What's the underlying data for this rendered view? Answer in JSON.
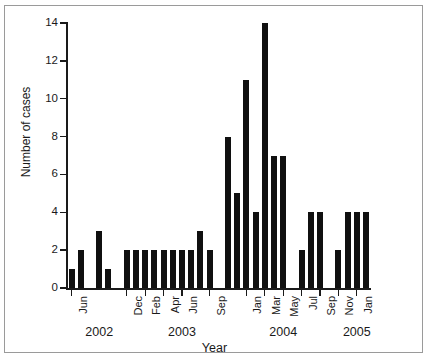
{
  "figure": {
    "title": "",
    "border_color": "#9a9a9a",
    "background": "#ffffff"
  },
  "axis": {
    "y_title": "Number of cases",
    "x_title": "Year",
    "bar_color": "#101010",
    "axis_color": "#1a1a1a"
  },
  "chart_data": {
    "type": "bar",
    "title": "",
    "subtitle": "",
    "xlabel": "Year",
    "ylabel": "Number of cases",
    "ylim": [
      0,
      14
    ],
    "yticks": [
      0,
      2,
      4,
      6,
      8,
      10,
      12,
      14
    ],
    "ytick_labels": [
      "0",
      "2",
      "4",
      "6",
      "8",
      "10",
      "12",
      "14"
    ],
    "grid": false,
    "legend": null,
    "legend_position": "none",
    "bar_color": "#101010",
    "x_tick_labels_shown": [
      "Jun",
      "Dec",
      "Feb",
      "Apr",
      "Jun",
      "Sep",
      "Jan",
      "Mar",
      "May",
      "Jul",
      "Sep",
      "Nov",
      "Jan"
    ],
    "year_group_labels": [
      "2002",
      "2003",
      "2004",
      "2005"
    ],
    "categories": [
      "Jun 2002",
      "Jul 2002",
      "Aug 2002",
      "Sep 2002",
      "Oct 2002",
      "Nov 2002",
      "Dec 2002",
      "Jan 2003",
      "Feb 2003",
      "Mar 2003",
      "Apr 2003",
      "May 2003",
      "Jun 2003",
      "Jul 2003",
      "Aug 2003",
      "Sep 2003",
      "Oct 2003",
      "Nov 2003",
      "Dec 2003",
      "Jan 2004",
      "Feb 2004",
      "Mar 2004",
      "Apr 2004",
      "May 2004",
      "Jun 2004",
      "Jul 2004",
      "Aug 2004",
      "Sep 2004",
      "Oct 2004",
      "Nov 2004",
      "Dec 2004",
      "Jan 2005",
      "Feb 2005"
    ],
    "values": [
      1,
      2,
      0,
      3,
      1,
      0,
      2,
      2,
      2,
      2,
      2,
      2,
      2,
      2,
      3,
      2,
      0,
      8,
      5,
      11,
      4,
      14,
      7,
      7,
      0,
      2,
      4,
      4,
      0,
      2,
      4,
      4,
      4
    ]
  },
  "x_ticks": [
    {
      "label": "Jun",
      "index": 0
    },
    {
      "label": "Dec",
      "index": 6
    },
    {
      "label": "Feb",
      "index": 8
    },
    {
      "label": "Apr",
      "index": 10
    },
    {
      "label": "Jun",
      "index": 12
    },
    {
      "label": "Sep",
      "index": 15
    },
    {
      "label": "Jan",
      "index": 19
    },
    {
      "label": "Mar",
      "index": 21
    },
    {
      "label": "May",
      "index": 23
    },
    {
      "label": "Jul",
      "index": 25
    },
    {
      "label": "Sep",
      "index": 27
    },
    {
      "label": "Nov",
      "index": 29
    },
    {
      "label": "Jan",
      "index": 31
    }
  ],
  "year_groups": [
    {
      "label": "2002",
      "center_index": 3
    },
    {
      "label": "2003",
      "center_index": 12
    },
    {
      "label": "2004",
      "center_index": 23
    },
    {
      "label": "2005",
      "center_index": 31
    }
  ]
}
